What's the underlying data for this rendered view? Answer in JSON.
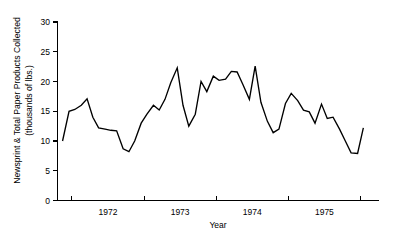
{
  "chart_data": {
    "type": "line",
    "title": "",
    "xlabel": "Year",
    "ylabel_line1": "Newsprint & Total Paper Products Collected",
    "ylabel_line2": "(thousands of lbs.)",
    "ylim": [
      0,
      30
    ],
    "yticks": [
      0,
      5,
      10,
      15,
      20,
      25,
      30
    ],
    "ytick_labels": [
      "0",
      "5",
      "10",
      "15",
      "20",
      "25",
      "30"
    ],
    "xtick_labels": [
      "1972",
      "1973",
      "1974",
      "1975"
    ],
    "xtick_positions_years": [
      1971.75,
      1972.75,
      1973.75,
      1974.75,
      1975.75
    ],
    "xlim": [
      1971.55,
      1976.0
    ],
    "grid": false,
    "legend": null,
    "series": [
      {
        "name": "Newsprint & total paper products collected",
        "x": [
          1971.62,
          1971.71,
          1971.79,
          1971.88,
          1971.96,
          1972.04,
          1972.12,
          1972.21,
          1972.29,
          1972.37,
          1972.46,
          1972.54,
          1972.62,
          1972.71,
          1972.79,
          1972.88,
          1972.96,
          1973.04,
          1973.12,
          1973.21,
          1973.29,
          1973.37,
          1973.46,
          1973.54,
          1973.62,
          1973.71,
          1973.79,
          1973.88,
          1973.96,
          1974.04,
          1974.12,
          1974.21,
          1974.29,
          1974.37,
          1974.46,
          1974.54,
          1974.62,
          1974.71,
          1974.79,
          1974.88,
          1974.96,
          1975.04,
          1975.12,
          1975.21,
          1975.29,
          1975.37,
          1975.46,
          1975.54,
          1975.62,
          1975.71,
          1975.79
        ],
        "y": [
          10.0,
          15.0,
          15.3,
          16.0,
          17.1,
          14.0,
          12.2,
          12.0,
          11.8,
          11.7,
          8.7,
          8.2,
          10.0,
          13.0,
          14.5,
          16.0,
          15.2,
          17.0,
          19.8,
          22.3,
          16.0,
          12.5,
          14.5,
          20.0,
          18.3,
          20.9,
          20.2,
          20.4,
          21.7,
          21.6,
          19.5,
          17.0,
          22.6,
          16.5,
          13.3,
          11.4,
          12.0,
          16.3,
          18.0,
          16.8,
          15.2,
          14.9,
          13.0,
          16.2,
          13.8,
          14.0,
          12.0,
          10.0,
          8.0,
          7.9,
          12.2
        ]
      }
    ]
  }
}
